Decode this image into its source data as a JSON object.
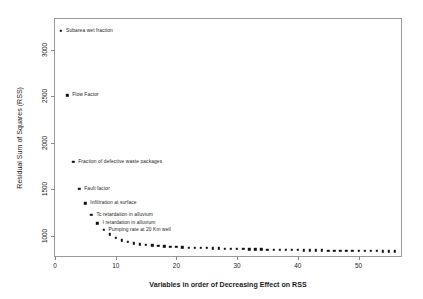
{
  "chart_data": {
    "type": "scatter",
    "title": "",
    "xlabel": "Variables in order of  Decreasing Effect on RSS",
    "ylabel": "Residual Sum of Squares (RSS)",
    "xlim": [
      0,
      57
    ],
    "ylim": [
      780,
      3330
    ],
    "xticks": [
      0,
      10,
      20,
      30,
      40,
      50
    ],
    "xticklabels": [
      "0",
      "10",
      "20",
      "30",
      "40",
      "50"
    ],
    "yticks": [
      1000,
      1500,
      2000,
      2500,
      3000
    ],
    "yticklabels": [
      "1000",
      "1500",
      "2000",
      "2500",
      "3000"
    ],
    "grid": false,
    "legend": false,
    "marker": "square",
    "marker_color": "#111111",
    "frame": true,
    "x": [
      1,
      2,
      3,
      4,
      5,
      6,
      7,
      8,
      9,
      10,
      11,
      12,
      13,
      14,
      15,
      16,
      17,
      18,
      19,
      20,
      21,
      22,
      23,
      24,
      25,
      26,
      27,
      28,
      29,
      30,
      31,
      32,
      33,
      34,
      35,
      36,
      37,
      38,
      39,
      40,
      41,
      42,
      43,
      44,
      45,
      46,
      47,
      48,
      49,
      50,
      51,
      52,
      53,
      54,
      55,
      56
    ],
    "y": [
      3200,
      2510,
      1795,
      1500,
      1345,
      1220,
      1130,
      1065,
      1015,
      975,
      948,
      930,
      917,
      907,
      899,
      893,
      888,
      884,
      880,
      877,
      874,
      871,
      869,
      867,
      865,
      863,
      861,
      859,
      858,
      856,
      855,
      853,
      852,
      851,
      849,
      848,
      847,
      846,
      845,
      844,
      843,
      842,
      841,
      840,
      839,
      838,
      837,
      836,
      836,
      835,
      834,
      833,
      833,
      832,
      831,
      831
    ],
    "annotations": [
      {
        "index": 1,
        "label": "Subarea wet fraction"
      },
      {
        "index": 2,
        "label": "Flow Factor"
      },
      {
        "index": 3,
        "label": "Fraction of defective waste packages"
      },
      {
        "index": 4,
        "label": "Fault factor"
      },
      {
        "index": 5,
        "label": "Infiltration at surface"
      },
      {
        "index": 6,
        "label": "Tc retardation in alluvium"
      },
      {
        "index": 7,
        "label": "I retardation in alluvium"
      },
      {
        "index": 8,
        "label": "Pumping rate at 20 Km well"
      }
    ]
  }
}
